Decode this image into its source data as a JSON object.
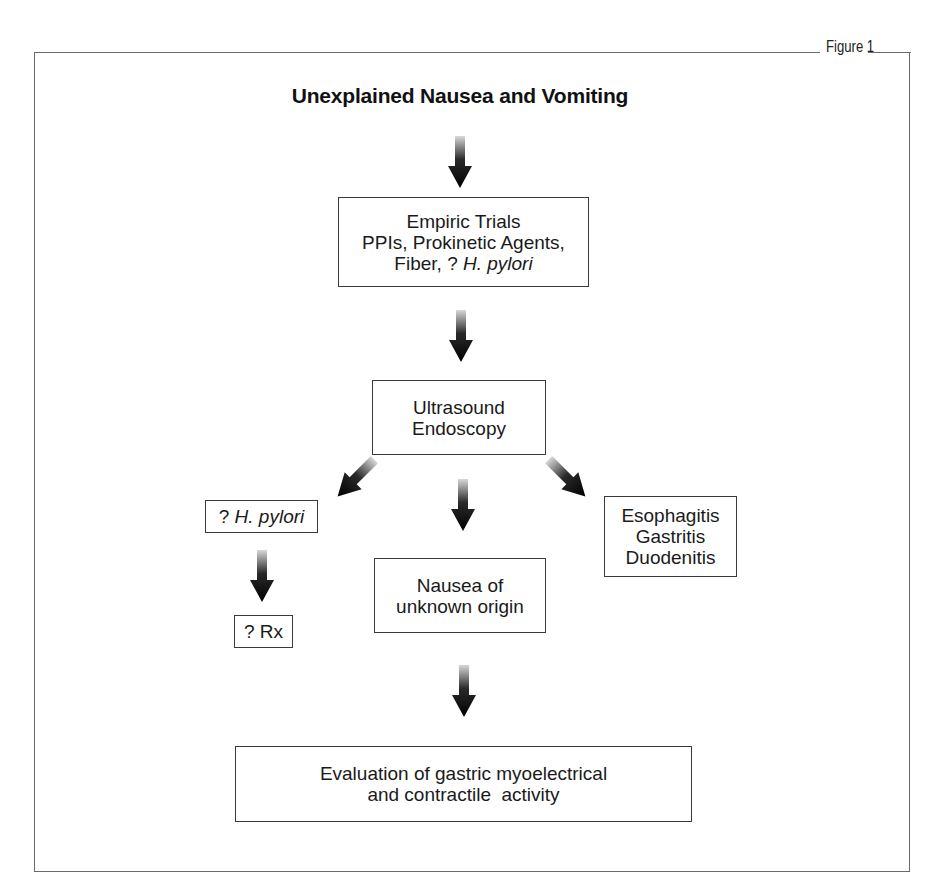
{
  "figure": {
    "label": "Figure 1",
    "title": "Unexplained Nausea and Vomiting"
  },
  "nodes": {
    "empiric": {
      "line1": "Empiric Trials",
      "line2": "PPIs, Prokinetic Agents,",
      "line3_prefix": "Fiber, ? ",
      "line3_italic": "H. pylori"
    },
    "ultrasound": {
      "line1": "Ultrasound",
      "line2": "Endoscopy"
    },
    "hpylori": {
      "prefix": "? ",
      "italic": "H. pylori"
    },
    "rx": {
      "label": "? Rx"
    },
    "nausea_unknown": {
      "line1": "Nausea of",
      "line2": "unknown origin"
    },
    "inflammation": {
      "line1": "Esophagitis",
      "line2": "Gastritis",
      "line3": "Duodenitis"
    },
    "evaluation": {
      "line1": "Evaluation of gastric myoelectrical",
      "line2": "and contractile  activity"
    }
  },
  "edges": [
    {
      "from": "title",
      "to": "empiric"
    },
    {
      "from": "empiric",
      "to": "ultrasound"
    },
    {
      "from": "ultrasound",
      "to": "hpylori"
    },
    {
      "from": "ultrasound",
      "to": "nausea_unknown"
    },
    {
      "from": "ultrasound",
      "to": "inflammation"
    },
    {
      "from": "hpylori",
      "to": "rx"
    },
    {
      "from": "nausea_unknown",
      "to": "evaluation"
    }
  ],
  "colors": {
    "arrow_dark": "#0a0a0a",
    "arrow_light": "#cfcfcf",
    "border": "#3a3a3a",
    "frame": "#6a6a6a"
  }
}
